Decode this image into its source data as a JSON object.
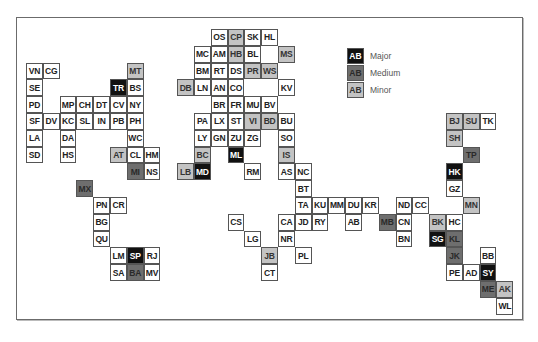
{
  "legend": [
    {
      "code": "AB",
      "label": "Major",
      "level": "major"
    },
    {
      "code": "AB",
      "label": "Medium",
      "level": "medium"
    },
    {
      "code": "AB",
      "label": "Minor",
      "level": "minor"
    }
  ],
  "colors": {
    "major": "#111111",
    "medium": "#6e6e6e",
    "minor": "#c3c3c3",
    "none": "#ffffff"
  },
  "cells": [
    {
      "code": "OS",
      "c": 11,
      "r": 0,
      "l": "none"
    },
    {
      "code": "CP",
      "c": 12,
      "r": 0,
      "l": "minor"
    },
    {
      "code": "SK",
      "c": 13,
      "r": 0,
      "l": "none"
    },
    {
      "code": "HL",
      "c": 14,
      "r": 0,
      "l": "none"
    },
    {
      "code": "MC",
      "c": 10,
      "r": 1,
      "l": "none"
    },
    {
      "code": "AM",
      "c": 11,
      "r": 1,
      "l": "none"
    },
    {
      "code": "HB",
      "c": 12,
      "r": 1,
      "l": "minor"
    },
    {
      "code": "BL",
      "c": 13,
      "r": 1,
      "l": "none"
    },
    {
      "code": "MS",
      "c": 15,
      "r": 1,
      "l": "minor"
    },
    {
      "code": "VN",
      "c": 0,
      "r": 2,
      "l": "none"
    },
    {
      "code": "CG",
      "c": 1,
      "r": 2,
      "l": "none"
    },
    {
      "code": "MT",
      "c": 6,
      "r": 2,
      "l": "minor"
    },
    {
      "code": "BM",
      "c": 10,
      "r": 2,
      "l": "none"
    },
    {
      "code": "RT",
      "c": 11,
      "r": 2,
      "l": "none"
    },
    {
      "code": "DS",
      "c": 12,
      "r": 2,
      "l": "none"
    },
    {
      "code": "PR",
      "c": 13,
      "r": 2,
      "l": "minor"
    },
    {
      "code": "WS",
      "c": 14,
      "r": 2,
      "l": "minor"
    },
    {
      "code": "SE",
      "c": 0,
      "r": 3,
      "l": "none"
    },
    {
      "code": "TR",
      "c": 5,
      "r": 3,
      "l": "major"
    },
    {
      "code": "BS",
      "c": 6,
      "r": 3,
      "l": "none"
    },
    {
      "code": "DB",
      "c": 9,
      "r": 3,
      "l": "minor"
    },
    {
      "code": "LN",
      "c": 10,
      "r": 3,
      "l": "none"
    },
    {
      "code": "AN",
      "c": 11,
      "r": 3,
      "l": "none"
    },
    {
      "code": "CO",
      "c": 12,
      "r": 3,
      "l": "none"
    },
    {
      "code": "KV",
      "c": 15,
      "r": 3,
      "l": "none"
    },
    {
      "code": "PD",
      "c": 0,
      "r": 4,
      "l": "none"
    },
    {
      "code": "MP",
      "c": 2,
      "r": 4,
      "l": "none"
    },
    {
      "code": "CH",
      "c": 3,
      "r": 4,
      "l": "none"
    },
    {
      "code": "DT",
      "c": 4,
      "r": 4,
      "l": "none"
    },
    {
      "code": "CV",
      "c": 5,
      "r": 4,
      "l": "none"
    },
    {
      "code": "NY",
      "c": 6,
      "r": 4,
      "l": "none"
    },
    {
      "code": "BR",
      "c": 11,
      "r": 4,
      "l": "none"
    },
    {
      "code": "FR",
      "c": 12,
      "r": 4,
      "l": "none"
    },
    {
      "code": "MU",
      "c": 13,
      "r": 4,
      "l": "none"
    },
    {
      "code": "BV",
      "c": 14,
      "r": 4,
      "l": "none"
    },
    {
      "code": "SF",
      "c": 0,
      "r": 5,
      "l": "none"
    },
    {
      "code": "DV",
      "c": 1,
      "r": 5,
      "l": "none"
    },
    {
      "code": "KC",
      "c": 2,
      "r": 5,
      "l": "none"
    },
    {
      "code": "SL",
      "c": 3,
      "r": 5,
      "l": "none"
    },
    {
      "code": "IN",
      "c": 4,
      "r": 5,
      "l": "none"
    },
    {
      "code": "PB",
      "c": 5,
      "r": 5,
      "l": "none"
    },
    {
      "code": "PH",
      "c": 6,
      "r": 5,
      "l": "none"
    },
    {
      "code": "PA",
      "c": 10,
      "r": 5,
      "l": "none"
    },
    {
      "code": "LX",
      "c": 11,
      "r": 5,
      "l": "none"
    },
    {
      "code": "ST",
      "c": 12,
      "r": 5,
      "l": "none"
    },
    {
      "code": "VI",
      "c": 13,
      "r": 5,
      "l": "minor"
    },
    {
      "code": "BD",
      "c": 14,
      "r": 5,
      "l": "minor"
    },
    {
      "code": "BU",
      "c": 15,
      "r": 5,
      "l": "none"
    },
    {
      "code": "BJ",
      "c": 25,
      "r": 5,
      "l": "minor"
    },
    {
      "code": "SU",
      "c": 26,
      "r": 5,
      "l": "minor"
    },
    {
      "code": "TK",
      "c": 27,
      "r": 5,
      "l": "none"
    },
    {
      "code": "LA",
      "c": 0,
      "r": 6,
      "l": "none"
    },
    {
      "code": "DA",
      "c": 2,
      "r": 6,
      "l": "none"
    },
    {
      "code": "WC",
      "c": 6,
      "r": 6,
      "l": "none"
    },
    {
      "code": "LY",
      "c": 10,
      "r": 6,
      "l": "none"
    },
    {
      "code": "GN",
      "c": 11,
      "r": 6,
      "l": "none"
    },
    {
      "code": "ZU",
      "c": 12,
      "r": 6,
      "l": "none"
    },
    {
      "code": "ZG",
      "c": 13,
      "r": 6,
      "l": "none"
    },
    {
      "code": "SO",
      "c": 15,
      "r": 6,
      "l": "none"
    },
    {
      "code": "SH",
      "c": 25,
      "r": 6,
      "l": "minor"
    },
    {
      "code": "SD",
      "c": 0,
      "r": 7,
      "l": "none"
    },
    {
      "code": "HS",
      "c": 2,
      "r": 7,
      "l": "none"
    },
    {
      "code": "AT",
      "c": 5,
      "r": 7,
      "l": "minor"
    },
    {
      "code": "CL",
      "c": 6,
      "r": 7,
      "l": "none"
    },
    {
      "code": "HM",
      "c": 7,
      "r": 7,
      "l": "none"
    },
    {
      "code": "BC",
      "c": 10,
      "r": 7,
      "l": "minor"
    },
    {
      "code": "ML",
      "c": 12,
      "r": 7,
      "l": "major"
    },
    {
      "code": "IS",
      "c": 15,
      "r": 7,
      "l": "minor"
    },
    {
      "code": "TP",
      "c": 26,
      "r": 7,
      "l": "medium"
    },
    {
      "code": "MI",
      "c": 6,
      "r": 8,
      "l": "medium"
    },
    {
      "code": "NS",
      "c": 7,
      "r": 8,
      "l": "none"
    },
    {
      "code": "LB",
      "c": 9,
      "r": 8,
      "l": "minor"
    },
    {
      "code": "MD",
      "c": 10,
      "r": 8,
      "l": "major"
    },
    {
      "code": "RM",
      "c": 13,
      "r": 8,
      "l": "none"
    },
    {
      "code": "AS",
      "c": 15,
      "r": 8,
      "l": "none"
    },
    {
      "code": "NC",
      "c": 16,
      "r": 8,
      "l": "none"
    },
    {
      "code": "HK",
      "c": 25,
      "r": 8,
      "l": "major"
    },
    {
      "code": "MX",
      "c": 3,
      "r": 9,
      "l": "medium"
    },
    {
      "code": "BT",
      "c": 16,
      "r": 9,
      "l": "none"
    },
    {
      "code": "GZ",
      "c": 25,
      "r": 9,
      "l": "none"
    },
    {
      "code": "PN",
      "c": 4,
      "r": 10,
      "l": "none"
    },
    {
      "code": "CR",
      "c": 5,
      "r": 10,
      "l": "none"
    },
    {
      "code": "TA",
      "c": 16,
      "r": 10,
      "l": "none"
    },
    {
      "code": "KU",
      "c": 17,
      "r": 10,
      "l": "none"
    },
    {
      "code": "MM",
      "c": 18,
      "r": 10,
      "l": "none"
    },
    {
      "code": "DU",
      "c": 19,
      "r": 10,
      "l": "none"
    },
    {
      "code": "KR",
      "c": 20,
      "r": 10,
      "l": "none"
    },
    {
      "code": "ND",
      "c": 22,
      "r": 10,
      "l": "none"
    },
    {
      "code": "CC",
      "c": 23,
      "r": 10,
      "l": "none"
    },
    {
      "code": "MN",
      "c": 26,
      "r": 10,
      "l": "minor"
    },
    {
      "code": "BG",
      "c": 4,
      "r": 11,
      "l": "none"
    },
    {
      "code": "CS",
      "c": 12,
      "r": 11,
      "l": "none"
    },
    {
      "code": "CA",
      "c": 15,
      "r": 11,
      "l": "none"
    },
    {
      "code": "JD",
      "c": 16,
      "r": 11,
      "l": "none"
    },
    {
      "code": "RY",
      "c": 17,
      "r": 11,
      "l": "none"
    },
    {
      "code": "AB",
      "c": 19,
      "r": 11,
      "l": "none"
    },
    {
      "code": "MB",
      "c": 21,
      "r": 11,
      "l": "medium"
    },
    {
      "code": "CN",
      "c": 22,
      "r": 11,
      "l": "none"
    },
    {
      "code": "BK",
      "c": 24,
      "r": 11,
      "l": "minor"
    },
    {
      "code": "HC",
      "c": 25,
      "r": 11,
      "l": "none"
    },
    {
      "code": "QU",
      "c": 4,
      "r": 12,
      "l": "none"
    },
    {
      "code": "LG",
      "c": 13,
      "r": 12,
      "l": "none"
    },
    {
      "code": "NR",
      "c": 15,
      "r": 12,
      "l": "none"
    },
    {
      "code": "BN",
      "c": 22,
      "r": 12,
      "l": "none"
    },
    {
      "code": "SG",
      "c": 24,
      "r": 12,
      "l": "major"
    },
    {
      "code": "KL",
      "c": 25,
      "r": 12,
      "l": "medium"
    },
    {
      "code": "LM",
      "c": 5,
      "r": 13,
      "l": "none"
    },
    {
      "code": "SP",
      "c": 6,
      "r": 13,
      "l": "major"
    },
    {
      "code": "RJ",
      "c": 7,
      "r": 13,
      "l": "none"
    },
    {
      "code": "JB",
      "c": 14,
      "r": 13,
      "l": "minor"
    },
    {
      "code": "PL",
      "c": 16,
      "r": 13,
      "l": "none"
    },
    {
      "code": "JK",
      "c": 25,
      "r": 13,
      "l": "medium"
    },
    {
      "code": "BB",
      "c": 27,
      "r": 13,
      "l": "none"
    },
    {
      "code": "SA",
      "c": 5,
      "r": 14,
      "l": "none"
    },
    {
      "code": "BA",
      "c": 6,
      "r": 14,
      "l": "medium"
    },
    {
      "code": "MV",
      "c": 7,
      "r": 14,
      "l": "none"
    },
    {
      "code": "CT",
      "c": 14,
      "r": 14,
      "l": "none"
    },
    {
      "code": "PE",
      "c": 25,
      "r": 14,
      "l": "none"
    },
    {
      "code": "AD",
      "c": 26,
      "r": 14,
      "l": "none"
    },
    {
      "code": "SY",
      "c": 27,
      "r": 14,
      "l": "major"
    },
    {
      "code": "ME",
      "c": 27,
      "r": 15,
      "l": "medium"
    },
    {
      "code": "AK",
      "c": 28,
      "r": 15,
      "l": "minor"
    },
    {
      "code": "WL",
      "c": 28,
      "r": 16,
      "l": "none"
    }
  ]
}
